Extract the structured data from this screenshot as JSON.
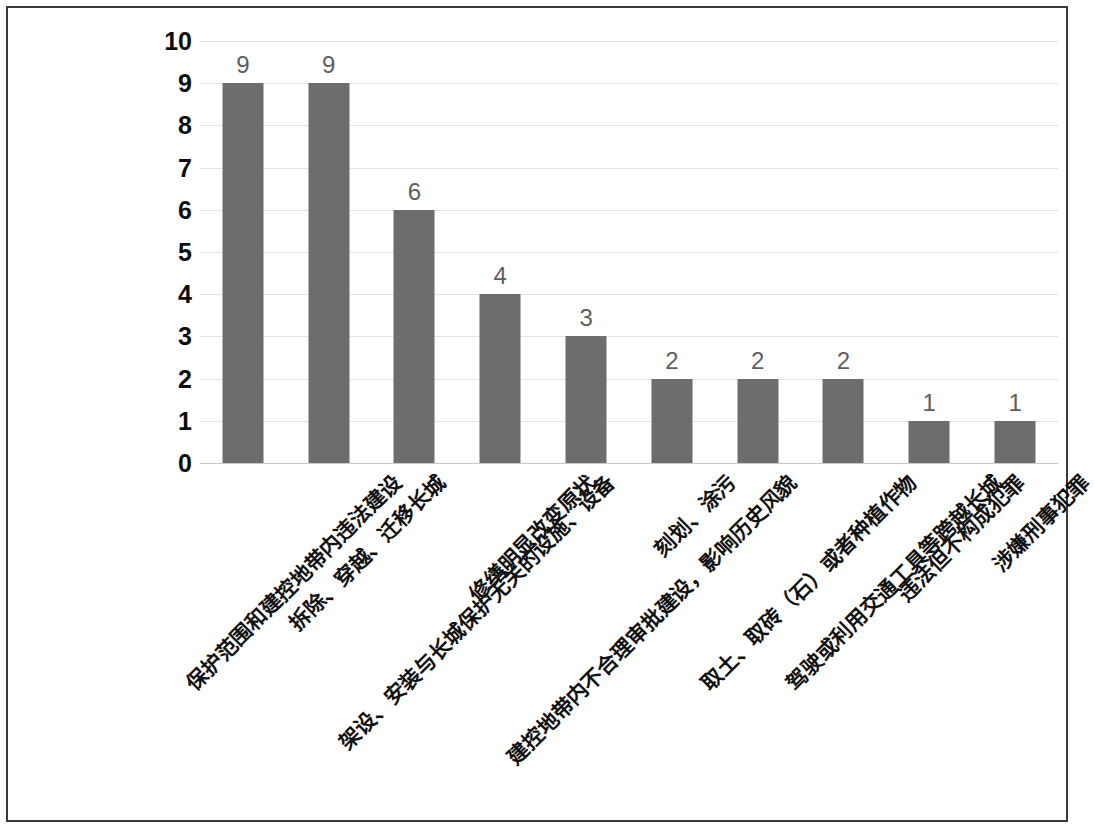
{
  "chart_data": {
    "type": "bar",
    "title": "",
    "subtitle": "",
    "xlabel": "",
    "ylabel": "",
    "ylim": [
      0,
      10
    ],
    "yticks": [
      "0",
      "1",
      "2",
      "3",
      "4",
      "5",
      "6",
      "7",
      "8",
      "9",
      "10"
    ],
    "grid": true,
    "legend": false,
    "legend_position": "none",
    "bar_color": "#6d6d6d",
    "gridline_color": "#e3e3e3",
    "axis_color": "#c9c9c9",
    "categories": [
      "保护范围和建控地带内违法建设",
      "拆除、穿越、迁移长城",
      "架设、安装与长城保护无关的设施、设备",
      "修缮明显改变原状",
      "建控地带内不合理审批建设，影响历史风貌",
      "刻划、涂污",
      "取土、取砖（石）或者种植作物",
      "驾驶或利用交通工具等跨越长城",
      "违法但不构成犯罪",
      "涉嫌刑事犯罪"
    ],
    "values": [
      9,
      9,
      6,
      4,
      3,
      2,
      2,
      2,
      1,
      1
    ],
    "data_labels": [
      "9",
      "9",
      "6",
      "4",
      "3",
      "2",
      "2",
      "2",
      "1",
      "1"
    ]
  }
}
